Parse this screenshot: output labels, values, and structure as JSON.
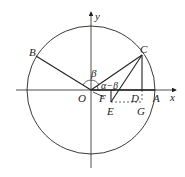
{
  "diagram": {
    "labels": {
      "y": "y",
      "x": "x",
      "O": "O",
      "A": "A",
      "B": "B",
      "C": "C",
      "D": "D",
      "E": "E",
      "F": "F",
      "G": "G",
      "beta": "β",
      "alpha_minus_beta": "α−β"
    },
    "colors": {
      "line": "#222222",
      "background": "#ffffff"
    }
  }
}
